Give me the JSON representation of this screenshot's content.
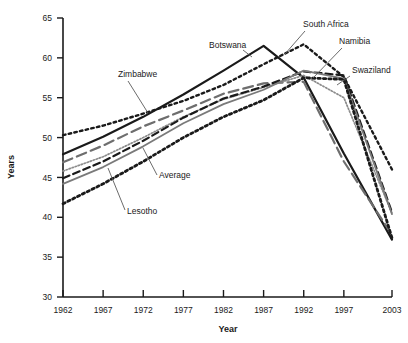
{
  "chart_data": {
    "type": "line",
    "title": "",
    "xlabel": "Year",
    "ylabel": "Years",
    "xlim": [
      1962,
      2003
    ],
    "ylim": [
      30,
      65
    ],
    "ytick_values": [
      30,
      35,
      40,
      45,
      50,
      55,
      60,
      65
    ],
    "ytick_labels": [
      "30",
      "35",
      "40",
      "45",
      "50",
      "55",
      "60",
      "65"
    ],
    "xtick_values": [
      1962,
      1967,
      1972,
      1977,
      1982,
      1987,
      1992,
      1997,
      2003
    ],
    "xtick_labels": [
      "1962",
      "1967",
      "1972",
      "1977",
      "1982",
      "1987",
      "1992",
      "1997",
      "2003"
    ],
    "grid": false,
    "legend": "inline-annotations",
    "x": [
      1962,
      1967,
      1972,
      1977,
      1982,
      1987,
      1992,
      1997,
      2003
    ],
    "series": [
      {
        "name": "South Africa",
        "style": "coarse-dotted",
        "color": "#1a1a1a",
        "values": [
          50.3,
          51.5,
          53.0,
          54.6,
          56.6,
          59.2,
          61.7,
          57.6,
          46.0
        ]
      },
      {
        "name": "Botswana",
        "style": "solid",
        "color": "#1a1a1a",
        "values": [
          47.9,
          50.1,
          52.6,
          55.4,
          58.4,
          61.5,
          57.5,
          48.0,
          37.2
        ]
      },
      {
        "name": "Zimbabwe",
        "style": "long-dash",
        "color": "#6e6e6e",
        "values": [
          46.9,
          49.0,
          51.4,
          53.4,
          55.5,
          56.8,
          57.0,
          47.0,
          37.8
        ]
      },
      {
        "name": "Swaziland",
        "style": "fine-dotted",
        "color": "#8c8c8c",
        "values": [
          45.8,
          47.6,
          50.0,
          52.6,
          54.8,
          56.3,
          57.8,
          55.0,
          40.5
        ]
      },
      {
        "name": "Namibia",
        "style": "dashed",
        "color": "#1a1a1a",
        "values": [
          44.9,
          47.0,
          49.6,
          52.5,
          54.9,
          56.4,
          58.3,
          57.8,
          40.6
        ]
      },
      {
        "name": "Average",
        "style": "solid-gray",
        "color": "#7a7a7a",
        "values": [
          44.2,
          46.3,
          48.9,
          51.8,
          54.2,
          56.0,
          58.4,
          57.4,
          40.4
        ]
      },
      {
        "name": "Lesotho",
        "style": "thick-dotted",
        "color": "#1a1a1a",
        "values": [
          41.7,
          44.2,
          47.0,
          50.0,
          52.6,
          54.7,
          57.5,
          57.3,
          37.4
        ]
      }
    ],
    "annotations": [
      {
        "text": "Zimbabwe",
        "label_x": 118,
        "label_y": 77,
        "line_x1": 128,
        "line_y1": 81,
        "line_x2": 148,
        "line_y2": 113
      },
      {
        "text": "Botswana",
        "label_x": 209,
        "label_y": 48,
        "line_x1": 243,
        "line_y1": 50,
        "line_x2": 252,
        "line_y2": 57
      },
      {
        "text": "South Africa",
        "label_x": 303,
        "label_y": 27,
        "line_x1": 305,
        "line_y1": 31,
        "line_x2": 285,
        "line_y2": 54
      },
      {
        "text": "Namibia",
        "label_x": 339,
        "label_y": 44,
        "line_x1": 342,
        "line_y1": 48,
        "line_x2": 313,
        "line_y2": 78
      },
      {
        "text": "Swaziland",
        "label_x": 352,
        "label_y": 73,
        "line_x1": 350,
        "line_y1": 76,
        "line_x2": 337,
        "line_y2": 85
      },
      {
        "text": "Average",
        "label_x": 159,
        "label_y": 178,
        "line_x1": 157,
        "line_y1": 175,
        "line_x2": 143,
        "line_y2": 148
      },
      {
        "text": "Lesotho",
        "label_x": 127,
        "label_y": 214,
        "line_x1": 125,
        "line_y1": 210,
        "line_x2": 108,
        "line_y2": 168
      }
    ]
  }
}
